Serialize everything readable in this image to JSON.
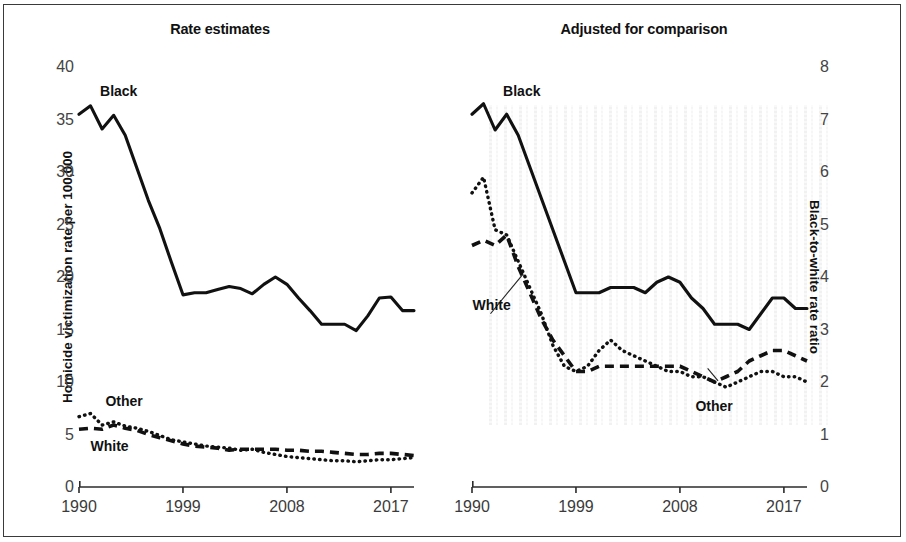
{
  "figure": {
    "border_color": "#3a3a3a",
    "series_color": "#111111"
  },
  "panels": {
    "left": {
      "title": "Rate estimates",
      "ylabel": "Homicide victimization rate per 100,000",
      "yticks": [
        "40",
        "35",
        "30",
        "25",
        "20",
        "15",
        "10",
        "5",
        "0"
      ],
      "xticks": [
        "1990",
        "1999",
        "2008",
        "2017"
      ],
      "labels": {
        "black": "Black",
        "white": "White",
        "other": "Other"
      }
    },
    "right": {
      "title": "Adjusted for comparison",
      "ylabel": "Black-to-white rate ratio",
      "yticks": [
        "8",
        "7",
        "6",
        "5",
        "4",
        "3",
        "2",
        "1",
        "0"
      ],
      "xticks": [
        "1990",
        "1999",
        "2008",
        "2017"
      ],
      "labels": {
        "black": "Black",
        "white": "White",
        "other": "Other"
      }
    }
  },
  "chart_data": [
    {
      "type": "line",
      "title": "Rate estimates",
      "xlabel": "",
      "ylabel": "Homicide victimization rate per 100,000",
      "xlim": [
        1990,
        2019
      ],
      "ylim": [
        0,
        40
      ],
      "ytick_values": [
        0,
        5,
        10,
        15,
        20,
        25,
        30,
        35,
        40
      ],
      "xtick_values": [
        1990,
        1999,
        2008,
        2017
      ],
      "grid": false,
      "legend": "inline-labels",
      "x": [
        1990,
        1991,
        1992,
        1993,
        1994,
        1995,
        1996,
        1997,
        1998,
        1999,
        2000,
        2001,
        2002,
        2003,
        2004,
        2005,
        2006,
        2007,
        2008,
        2009,
        2010,
        2011,
        2012,
        2013,
        2014,
        2015,
        2016,
        2017,
        2018,
        2019
      ],
      "series": [
        {
          "name": "Black",
          "style": "solid",
          "values": [
            35.5,
            36.3,
            34.1,
            35.4,
            33.5,
            30.4,
            27.3,
            24.6,
            21.4,
            18.3,
            18.5,
            18.5,
            18.8,
            19.1,
            18.9,
            18.4,
            19.3,
            20.0,
            19.3,
            18.0,
            16.8,
            15.5,
            15.5,
            15.5,
            14.9,
            16.3,
            18.0,
            18.1,
            16.8,
            16.8
          ]
        },
        {
          "name": "White",
          "style": "dashed",
          "values": [
            5.5,
            5.6,
            5.5,
            5.9,
            5.6,
            5.4,
            5.0,
            4.7,
            4.4,
            4.1,
            3.9,
            3.8,
            3.7,
            3.5,
            3.6,
            3.6,
            3.6,
            3.6,
            3.5,
            3.5,
            3.4,
            3.4,
            3.3,
            3.2,
            3.1,
            3.1,
            3.2,
            3.2,
            3.1,
            3.0
          ]
        },
        {
          "name": "Other",
          "style": "dotted",
          "values": [
            6.7,
            7.0,
            5.9,
            6.2,
            5.8,
            5.6,
            5.3,
            4.9,
            4.5,
            4.3,
            4.1,
            3.9,
            3.8,
            3.7,
            3.5,
            3.6,
            3.3,
            3.1,
            2.9,
            2.8,
            2.7,
            2.6,
            2.5,
            2.5,
            2.4,
            2.5,
            2.6,
            2.6,
            2.7,
            2.8
          ]
        }
      ]
    },
    {
      "type": "line",
      "title": "Adjusted for comparison",
      "xlabel": "",
      "ylabel": "Black-to-white rate ratio",
      "xlim": [
        1990,
        2019
      ],
      "ylim": [
        0,
        8
      ],
      "ytick_values": [
        0,
        1,
        2,
        3,
        4,
        5,
        6,
        7,
        8
      ],
      "xtick_values": [
        1990,
        1999,
        2008,
        2017
      ],
      "grid": false,
      "legend": "inline-labels",
      "x": [
        1990,
        1991,
        1992,
        1993,
        1994,
        1995,
        1996,
        1997,
        1998,
        1999,
        2000,
        2001,
        2002,
        2003,
        2004,
        2005,
        2006,
        2007,
        2008,
        2009,
        2010,
        2011,
        2012,
        2013,
        2014,
        2015,
        2016,
        2017,
        2018,
        2019
      ],
      "series": [
        {
          "name": "Black",
          "style": "solid",
          "values": [
            7.1,
            7.3,
            6.8,
            7.1,
            6.7,
            6.1,
            5.5,
            4.9,
            4.3,
            3.7,
            3.7,
            3.7,
            3.8,
            3.8,
            3.8,
            3.7,
            3.9,
            4.0,
            3.9,
            3.6,
            3.4,
            3.1,
            3.1,
            3.1,
            3.0,
            3.3,
            3.6,
            3.6,
            3.4,
            3.4
          ]
        },
        {
          "name": "White",
          "style": "dashed",
          "values": [
            4.6,
            4.7,
            4.6,
            4.8,
            4.2,
            3.7,
            3.2,
            2.8,
            2.5,
            2.2,
            2.2,
            2.3,
            2.3,
            2.3,
            2.3,
            2.3,
            2.3,
            2.3,
            2.3,
            2.2,
            2.1,
            2.0,
            2.1,
            2.2,
            2.4,
            2.5,
            2.6,
            2.6,
            2.5,
            2.4
          ]
        },
        {
          "name": "Other",
          "style": "dotted",
          "values": [
            5.6,
            5.9,
            4.9,
            4.8,
            4.3,
            3.8,
            3.3,
            2.7,
            2.3,
            2.2,
            2.3,
            2.6,
            2.8,
            2.6,
            2.5,
            2.4,
            2.3,
            2.2,
            2.2,
            2.1,
            2.1,
            2.0,
            1.9,
            2.0,
            2.1,
            2.2,
            2.2,
            2.1,
            2.1,
            2.0
          ]
        }
      ]
    }
  ]
}
